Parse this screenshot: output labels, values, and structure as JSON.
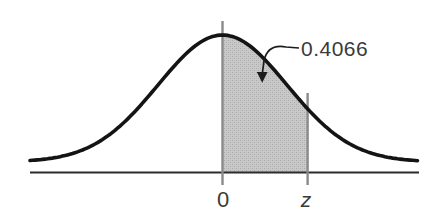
{
  "labels": {
    "annotation": "0.4066",
    "mean_tick": "0",
    "z_tick": "z"
  },
  "chart_data": {
    "type": "area",
    "title": "",
    "curve": "normal-distribution-density",
    "x_tick_labels": [
      "0",
      "z"
    ],
    "shaded_region": {
      "from": "0",
      "to": "z",
      "area": 0.4066
    },
    "z_value_sigma": 1.32,
    "annotations": [
      {
        "text": "0.4066",
        "target": "shaded-region",
        "style": "curved-arrow"
      }
    ],
    "grid": false,
    "legend": false,
    "colors": {
      "curve": "#141414",
      "baseline": "#2b2b2b",
      "guides": "#8a8a8a",
      "shade_light": "#c9c9c9",
      "shade_mid": "#bcbcbc",
      "shade_dark": "#a9a9a9",
      "arrow": "#1c1c1c",
      "text": "#3a3a3a"
    }
  }
}
